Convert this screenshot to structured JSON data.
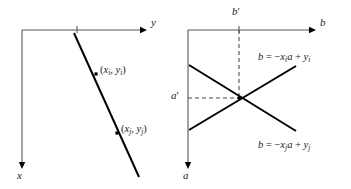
{
  "figure": {
    "type": "math-diagram",
    "background_color": "#ffffff",
    "line_color": "#000000",
    "axis_color": "#58585a",
    "dashed_color": "#4c4c4e"
  },
  "left_panel": {
    "name": "xy-space",
    "axes": {
      "horizontal_label": "y",
      "vertical_label": "x",
      "origin": {
        "x": 22,
        "y": 30
      },
      "horizontal_end": {
        "x": 144,
        "y": 30
      },
      "vertical_end": {
        "x": 22,
        "y": 166
      },
      "tick": {
        "x": 77,
        "y": 30,
        "length": 7
      }
    },
    "line": {
      "name": "line-through-points",
      "start": {
        "x": 74,
        "y": 33
      },
      "end": {
        "x": 139,
        "y": 177
      }
    },
    "points": [
      {
        "name": "point-i",
        "dot": {
          "x": 96,
          "y": 74
        },
        "label_parts": {
          "open": "(",
          "x_var": "x",
          "x_sub": "i",
          "comma": ", ",
          "y_var": "y",
          "y_sub": "i",
          "close": ")"
        },
        "label_text": "(xi, yi)",
        "label_pos": {
          "x": 100,
          "y": 65
        }
      },
      {
        "name": "point-j",
        "dot": {
          "x": 117,
          "y": 133
        },
        "label_parts": {
          "open": "(",
          "x_var": "x",
          "x_sub": "j",
          "comma": ", ",
          "y_var": "y",
          "y_sub": "j",
          "close": ")"
        },
        "label_text": "(xj, yj)",
        "label_pos": {
          "x": 121,
          "y": 124
        }
      }
    ]
  },
  "right_panel": {
    "name": "ab-parameter-space",
    "axes": {
      "horizontal_label": "b",
      "vertical_label": "a",
      "origin": {
        "x": 188,
        "y": 30
      },
      "horizontal_end": {
        "x": 313,
        "y": 30
      },
      "vertical_end": {
        "x": 188,
        "y": 166
      },
      "tick": {
        "x": 239,
        "y": 30,
        "length": 7
      }
    },
    "guides": [
      {
        "name": "b-prime-dashed-vertical",
        "label": "b'",
        "label_base": "b",
        "label_prime": "′",
        "from": {
          "x": 239,
          "y": 30
        },
        "to": {
          "x": 239,
          "y": 98
        },
        "label_pos": {
          "x": 232,
          "y": 6
        }
      },
      {
        "name": "a-prime-dashed-horizontal",
        "label": "a'",
        "label_base": "a",
        "label_prime": "′",
        "from": {
          "x": 188,
          "y": 98
        },
        "to": {
          "x": 239,
          "y": 98
        },
        "label_pos": {
          "x": 171,
          "y": 91
        }
      }
    ],
    "intersection": {
      "x": 239,
      "y": 98
    },
    "lines": [
      {
        "name": "line-i",
        "start": {
          "x": 189,
          "y": 130
        },
        "end": {
          "x": 296,
          "y": 66
        },
        "equation_text": "b = −xi a + yi",
        "equation_parts": {
          "lhs": "b",
          "eq": " = ",
          "minus": "−",
          "coef_var": "x",
          "coef_sub": "i",
          "mult_var": "a",
          "plus": " + ",
          "const_var": "y",
          "const_sub": "i"
        },
        "label_pos": {
          "x": 258,
          "y": 52
        }
      },
      {
        "name": "line-j",
        "start": {
          "x": 189,
          "y": 65
        },
        "end": {
          "x": 296,
          "y": 131
        },
        "equation_text": "b = −xj a + yj",
        "equation_parts": {
          "lhs": "b",
          "eq": " = ",
          "minus": "−",
          "coef_var": "x",
          "coef_sub": "j",
          "mult_var": "a",
          "plus": " + ",
          "const_var": "y",
          "const_sub": "j"
        },
        "label_pos": {
          "x": 258,
          "y": 140
        }
      }
    ]
  }
}
